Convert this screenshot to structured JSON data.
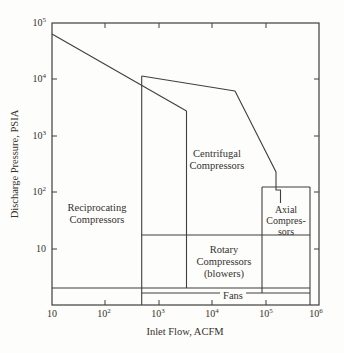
{
  "axes": {
    "x": {
      "title": "Inlet Flow, ACFM",
      "ticks": [
        {
          "base": "10",
          "exp": ""
        },
        {
          "base": "10",
          "exp": "2"
        },
        {
          "base": "10",
          "exp": "3"
        },
        {
          "base": "10",
          "exp": "4"
        },
        {
          "base": "10",
          "exp": "5"
        },
        {
          "base": "10",
          "exp": "6"
        }
      ]
    },
    "y": {
      "title": "Discharge Pressure, PSIA",
      "ticks": [
        {
          "base": "10",
          "exp": "5"
        },
        {
          "base": "10",
          "exp": "4"
        },
        {
          "base": "10",
          "exp": "3"
        },
        {
          "base": "10",
          "exp": "2"
        },
        {
          "base": "10",
          "exp": ""
        }
      ]
    }
  },
  "regions": {
    "reciprocating": {
      "lines": [
        "Reciprocating",
        "Compressors"
      ]
    },
    "centrifugal": {
      "lines": [
        "Centrifugal",
        "Compressors"
      ]
    },
    "rotary": {
      "lines": [
        "Rotary",
        "Compressors",
        "(blowers)"
      ]
    },
    "axial": {
      "lines": [
        "Axial",
        "Compres-",
        "sors"
      ]
    },
    "fans": {
      "lines": [
        "Fans"
      ]
    }
  },
  "colors": {
    "line": "#3f3f3f",
    "text": "#35322e",
    "background": "#fdfdfb"
  },
  "chart_data": {
    "type": "area",
    "subtype": "operating-range-envelopes",
    "title": "",
    "xlabel": "Inlet Flow, ACFM",
    "ylabel": "Discharge Pressure, PSIA",
    "x_scale": "log",
    "y_scale": "log",
    "xlim": [
      10,
      1000000
    ],
    "ylim": [
      1,
      100000
    ],
    "x_ticks": [
      10,
      100,
      1000,
      10000,
      100000,
      1000000
    ],
    "y_ticks": [
      10,
      100,
      1000,
      10000,
      100000
    ],
    "grid": false,
    "legend": "labels-inside-regions",
    "regions": [
      {
        "name": "Reciprocating Compressors",
        "flow_acfm": [
          10,
          3200
        ],
        "pressure_psia": [
          2,
          60000
        ],
        "boundary": [
          [
            10,
            60000
          ],
          [
            3200,
            2800
          ],
          [
            3200,
            2
          ],
          [
            10,
            2
          ]
        ]
      },
      {
        "name": "Centrifugal Compressors",
        "flow_acfm": [
          480,
          190000
        ],
        "pressure_psia": [
          1,
          10000
        ],
        "boundary": [
          [
            480,
            1
          ],
          [
            480,
            10000
          ],
          [
            27000,
            5600
          ],
          [
            160000,
            230
          ],
          [
            160000,
            110
          ],
          [
            190000,
            110
          ],
          [
            190000,
            64
          ]
        ]
      },
      {
        "name": "Axial Compressors",
        "flow_acfm": [
          86000,
          680000
        ],
        "pressure_psia": [
          17.5,
          123
        ],
        "boundary": [
          [
            86000,
            17.5
          ],
          [
            86000,
            123
          ],
          [
            680000,
            123
          ],
          [
            680000,
            17.5
          ]
        ]
      },
      {
        "name": "Rotary Compressors (blowers)",
        "flow_acfm": [
          480,
          86000
        ],
        "pressure_psia": [
          1.6,
          17.5
        ],
        "boundary": [
          [
            480,
            1.6
          ],
          [
            480,
            17.5
          ],
          [
            86000,
            17.5
          ],
          [
            86000,
            1.6
          ]
        ]
      },
      {
        "name": "Fans",
        "flow_acfm": [
          10,
          680000
        ],
        "pressure_psia": [
          1,
          2
        ],
        "boundary": [
          [
            10,
            1
          ],
          [
            10,
            2
          ],
          [
            680000,
            2
          ],
          [
            680000,
            1
          ]
        ]
      }
    ]
  },
  "geometry": {
    "plot": {
      "x": 52,
      "y": 23,
      "w": 267,
      "h": 282
    },
    "polylines": [
      {
        "name": "recip-top-boundary",
        "pts": [
          [
            52,
            34
          ],
          [
            186.5,
            111
          ]
        ]
      },
      {
        "name": "recip-right-boundary",
        "pts": [
          [
            186.5,
            111
          ],
          [
            186.5,
            288
          ]
        ]
      },
      {
        "name": "two-psia-line",
        "pts": [
          [
            52,
            288
          ],
          [
            310,
            288
          ]
        ]
      },
      {
        "name": "rotary-bottom-line",
        "pts": [
          [
            141.7,
            293
          ],
          [
            310,
            293
          ]
        ]
      },
      {
        "name": "rotary-top-line",
        "pts": [
          [
            141.7,
            235
          ],
          [
            310,
            235
          ]
        ]
      },
      {
        "name": "centrifugal-left-boundary",
        "pts": [
          [
            141.7,
            76
          ],
          [
            141.7,
            305
          ]
        ]
      },
      {
        "name": "centrifugal-top-boundary",
        "pts": [
          [
            141.7,
            76
          ],
          [
            235,
            91
          ]
        ]
      },
      {
        "name": "centrifugal-right-boundary",
        "pts": [
          [
            235,
            91
          ],
          [
            276,
            172
          ],
          [
            276,
            190
          ],
          [
            280.5,
            190
          ],
          [
            280.5,
            203
          ]
        ]
      },
      {
        "name": "axial-top-edge",
        "pts": [
          [
            262,
            187
          ],
          [
            310,
            187
          ]
        ]
      },
      {
        "name": "axial-left-edge",
        "pts": [
          [
            262,
            187
          ],
          [
            262,
            293
          ]
        ]
      },
      {
        "name": "axial-right-edge",
        "pts": [
          [
            310,
            187
          ],
          [
            310,
            305
          ]
        ]
      },
      {
        "name": "x-tick",
        "pts": [
          [
            105,
            305
          ],
          [
            105,
            300
          ]
        ]
      },
      {
        "name": "x-tick",
        "pts": [
          [
            159,
            305
          ],
          [
            159,
            300
          ]
        ]
      },
      {
        "name": "x-tick",
        "pts": [
          [
            212,
            305
          ],
          [
            212,
            300
          ]
        ]
      },
      {
        "name": "x-tick",
        "pts": [
          [
            266,
            305
          ],
          [
            266,
            300
          ]
        ]
      },
      {
        "name": "x-tick",
        "pts": [
          [
            105,
            23
          ],
          [
            105,
            28
          ]
        ]
      },
      {
        "name": "x-tick",
        "pts": [
          [
            159,
            23
          ],
          [
            159,
            28
          ]
        ]
      },
      {
        "name": "x-tick",
        "pts": [
          [
            212,
            23
          ],
          [
            212,
            28
          ]
        ]
      },
      {
        "name": "x-tick",
        "pts": [
          [
            266,
            23
          ],
          [
            266,
            28
          ]
        ]
      },
      {
        "name": "y-tick",
        "pts": [
          [
            52,
            79
          ],
          [
            57,
            79
          ]
        ]
      },
      {
        "name": "y-tick",
        "pts": [
          [
            52,
            136
          ],
          [
            57,
            136
          ]
        ]
      },
      {
        "name": "y-tick",
        "pts": [
          [
            52,
            192
          ],
          [
            57,
            192
          ]
        ]
      },
      {
        "name": "y-tick",
        "pts": [
          [
            52,
            249
          ],
          [
            57,
            249
          ]
        ]
      },
      {
        "name": "y-tick",
        "pts": [
          [
            319,
            79
          ],
          [
            314,
            79
          ]
        ]
      },
      {
        "name": "y-tick",
        "pts": [
          [
            319,
            136
          ],
          [
            314,
            136
          ]
        ]
      },
      {
        "name": "y-tick",
        "pts": [
          [
            319,
            192
          ],
          [
            314,
            192
          ]
        ]
      },
      {
        "name": "y-tick",
        "pts": [
          [
            319,
            249
          ],
          [
            314,
            249
          ]
        ]
      }
    ]
  }
}
